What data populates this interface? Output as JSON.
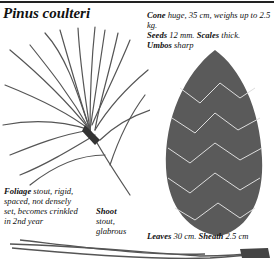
{
  "title": "Pinus coulteri",
  "notes": {
    "cone": {
      "label": "Cone",
      "text": " huge, 35 cm, weighs up to 2.5 kg."
    },
    "seeds": {
      "label": "Seeds",
      "text": " 12 mm. "
    },
    "scales": {
      "label": "Scales",
      "text": " thick."
    },
    "umbos": {
      "label": "Umbos",
      "text": " sharp"
    },
    "foliage": {
      "label": "Foliage",
      "text": " stout, rigid, spaced, not densely set, becomes crinkled in 2nd year"
    },
    "shoot": {
      "label": "Shoot",
      "text": "stout, glabrous"
    },
    "leaves": {
      "label": "Leaves",
      "text": " 30 cm. "
    },
    "sheath": {
      "label": "Sheath",
      "text": " 2.5 cm"
    }
  },
  "illustrations": [
    "foliage-shoot-illustration",
    "cone-illustration",
    "needle-leaf-illustration"
  ]
}
